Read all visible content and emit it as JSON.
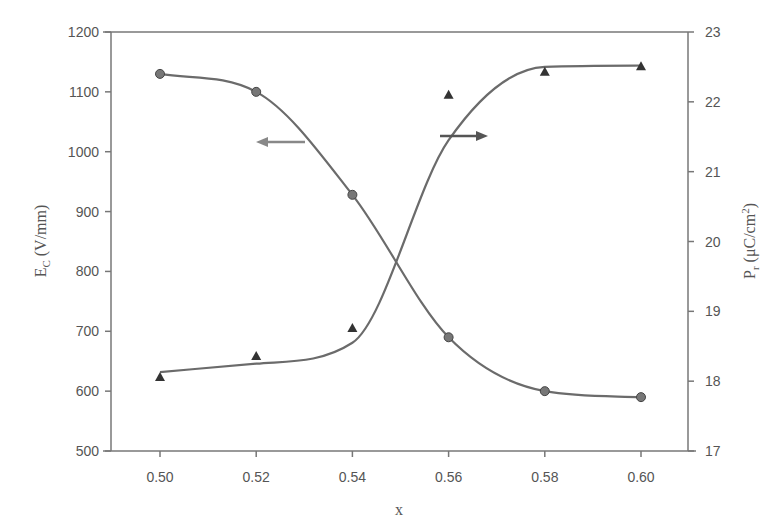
{
  "chart_data": {
    "type": "line",
    "title": "",
    "xlabel": "x",
    "ylabel_left": "E_C (V/mm)",
    "ylabel_right": "P_r (μC/cm²)",
    "x": [
      0.5,
      0.52,
      0.54,
      0.56,
      0.58,
      0.6
    ],
    "xlim": [
      0.49,
      0.611
    ],
    "ylim_left": [
      500,
      1200
    ],
    "ylim_right": [
      17,
      23
    ],
    "x_ticks": [
      "0.50",
      "0.52",
      "0.54",
      "0.56",
      "0.58",
      "0.60"
    ],
    "y_ticks_left": [
      "500",
      "600",
      "700",
      "800",
      "900",
      "1000",
      "1100",
      "1200"
    ],
    "y_ticks_right": [
      "17",
      "18",
      "19",
      "20",
      "21",
      "22",
      "23"
    ],
    "grid": false,
    "legend": "none (arrows indicate axis: left arrow → E_C, right arrow → P_r)",
    "series": [
      {
        "name": "E_C",
        "axis": "left",
        "marker": "circle",
        "values": [
          1130,
          1100,
          928,
          690,
          600,
          590
        ]
      },
      {
        "name": "P_r",
        "axis": "right",
        "marker": "triangle",
        "values": [
          18.06,
          18.36,
          18.76,
          22.1,
          22.43,
          22.51
        ]
      }
    ],
    "annotations": [
      {
        "type": "arrow",
        "direction": "left",
        "refers_to": "E_C"
      },
      {
        "type": "arrow",
        "direction": "right",
        "refers_to": "P_r"
      }
    ]
  },
  "labels": {
    "xlabel": "x",
    "ylabel_left_main": "E",
    "ylabel_left_sub": "C",
    "ylabel_left_unit": " (V/mm)",
    "ylabel_right_main": "P",
    "ylabel_right_sub": "r",
    "ylabel_right_unit": " (μC/cm",
    "ylabel_right_sup": "2",
    "ylabel_right_close": ")"
  },
  "colors": {
    "line": "#6b6b6b",
    "marker": "#555555",
    "axis": "#777777",
    "text": "#555555"
  }
}
